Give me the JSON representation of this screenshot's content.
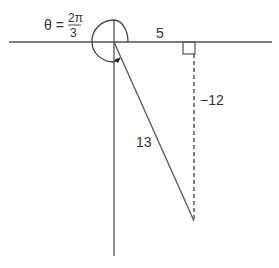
{
  "diagram": {
    "type": "trigonometry-reference-triangle",
    "angle_label": {
      "theta": "θ =",
      "numerator": "2π",
      "denominator": "3"
    },
    "sides": {
      "adjacent": "5",
      "opposite": "−12",
      "hypotenuse": "13"
    },
    "colors": {
      "line": "#555555",
      "text": "#333333",
      "background": "#ffffff"
    }
  }
}
